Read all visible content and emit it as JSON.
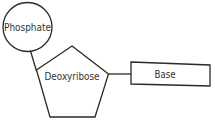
{
  "diagram": {
    "nodes": [
      {
        "id": "phosphate",
        "label": "Phosphate",
        "shape": "circle"
      },
      {
        "id": "deoxyribose",
        "label": "Deoxyribose",
        "shape": "pentagon"
      },
      {
        "id": "base",
        "label": "Base",
        "shape": "rectangle"
      }
    ],
    "edges": [
      {
        "from": "phosphate",
        "to": "deoxyribose"
      },
      {
        "from": "deoxyribose",
        "to": "base"
      }
    ],
    "colors": {
      "stroke": "#2a2a2a",
      "text": "#333333",
      "background": "#ffffff"
    }
  }
}
